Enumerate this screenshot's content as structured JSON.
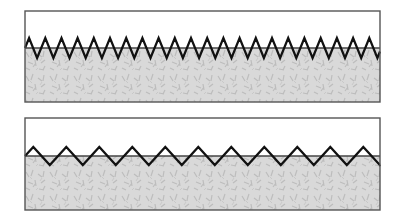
{
  "diagram": {
    "colors": {
      "background": "#ffffff",
      "frame": "#555555",
      "fill_lower": "#d6d6d6",
      "speckle": "#b8b8b8",
      "wave": "#111111",
      "baseline": "#444444"
    },
    "panels": [
      {
        "name": "high-frequency",
        "x": 25,
        "y": 11,
        "width": 355,
        "height": 91,
        "interface_y": 48,
        "wave_amplitude": 10,
        "wave_period": 16.2
      },
      {
        "name": "low-frequency",
        "x": 25,
        "y": 118,
        "width": 355,
        "height": 92,
        "interface_y": 156,
        "wave_amplitude": 9,
        "wave_period": 33
      }
    ]
  }
}
